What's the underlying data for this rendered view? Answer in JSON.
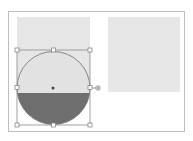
{
  "canvas": {
    "width": 193,
    "height": 141,
    "background": "#ffffff"
  },
  "frame": {
    "border_color": "#bdbdbd"
  },
  "shapes": {
    "left_square": {
      "x": 17,
      "y": 17,
      "w": 73,
      "h": 76,
      "fill": "#e6e6e6"
    },
    "right_square": {
      "x": 108,
      "y": 17,
      "w": 72,
      "h": 75,
      "fill": "#e6e6e6"
    },
    "circle": {
      "cx": 53.5,
      "cy": 88,
      "r": 36.5,
      "stroke": "#7a7a7a",
      "fill_top": "#e2e2e2",
      "fill_bottom": "#6e6e6e",
      "split_y": 93
    }
  },
  "selection": {
    "bbox": {
      "x": 17,
      "y": 50,
      "w": 73,
      "h": 75
    },
    "stroke": "#8a8a8a",
    "handle_fill": "#ffffff",
    "handle_stroke": "#7a7a7a",
    "center_dot": {
      "x": 53,
      "y": 88,
      "color": "#444444"
    },
    "connector_handle": {
      "x": 98,
      "y": 88
    }
  }
}
